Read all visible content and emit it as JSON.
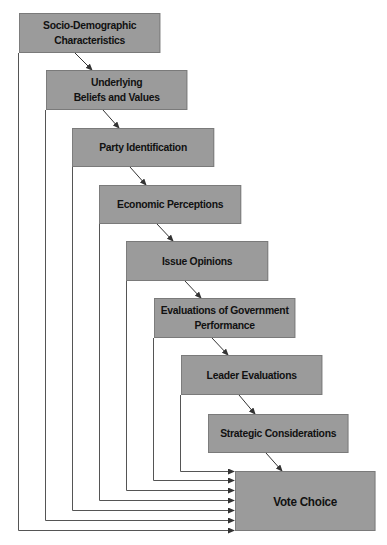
{
  "diagram": {
    "type": "funnel-of-causality",
    "nodes": [
      {
        "id": "n1",
        "label": "Socio-Demographic\nCharacteristics",
        "x": 19,
        "y": 13,
        "w": 141,
        "h": 40
      },
      {
        "id": "n2",
        "label": "Underlying\nBeliefs and Values",
        "x": 46,
        "y": 70,
        "w": 141,
        "h": 40
      },
      {
        "id": "n3",
        "label": "Party Identification",
        "x": 72,
        "y": 128,
        "w": 142,
        "h": 39
      },
      {
        "id": "n4",
        "label": "Economic Perceptions",
        "x": 99,
        "y": 185,
        "w": 142,
        "h": 39
      },
      {
        "id": "n5",
        "label": "Issue Opinions",
        "x": 126,
        "y": 241,
        "w": 142,
        "h": 40
      },
      {
        "id": "n6",
        "label": "Evaluations of Government\nPerformance",
        "x": 154,
        "y": 298,
        "w": 141,
        "h": 40
      },
      {
        "id": "n7",
        "label": "Leader Evaluations",
        "x": 181,
        "y": 355,
        "w": 141,
        "h": 40
      },
      {
        "id": "n8",
        "label": "Strategic Considerations",
        "x": 208,
        "y": 414,
        "w": 140,
        "h": 39
      },
      {
        "id": "n9",
        "label": "Vote Choice",
        "x": 235,
        "y": 471,
        "w": 140,
        "h": 60
      }
    ],
    "chain_edges": [
      {
        "from": "n1",
        "to": "n2"
      },
      {
        "from": "n2",
        "to": "n3"
      },
      {
        "from": "n3",
        "to": "n4"
      },
      {
        "from": "n4",
        "to": "n5"
      },
      {
        "from": "n5",
        "to": "n6"
      },
      {
        "from": "n6",
        "to": "n7"
      },
      {
        "from": "n7",
        "to": "n8"
      },
      {
        "from": "n8",
        "to": "n9"
      }
    ],
    "direct_edges": [
      {
        "from": "n1",
        "to": "n9"
      },
      {
        "from": "n2",
        "to": "n9"
      },
      {
        "from": "n3",
        "to": "n9"
      },
      {
        "from": "n4",
        "to": "n9"
      },
      {
        "from": "n5",
        "to": "n9"
      },
      {
        "from": "n6",
        "to": "n9"
      },
      {
        "from": "n7",
        "to": "n9"
      }
    ]
  },
  "labels": {
    "n1a": "Socio-Demographic",
    "n1b": "Characteristics",
    "n2a": "Underlying",
    "n2b": "Beliefs and Values",
    "n3": "Party Identification",
    "n4": "Economic Perceptions",
    "n5": "Issue Opinions",
    "n6a": "Evaluations of Government",
    "n6b": "Performance",
    "n7": "Leader Evaluations",
    "n8": "Strategic Considerations",
    "n9": "Vote Choice"
  },
  "colors": {
    "box_fill": "#9b9b9b",
    "box_border": "#7a7a7a",
    "line": "#333333",
    "text": "#111111"
  }
}
